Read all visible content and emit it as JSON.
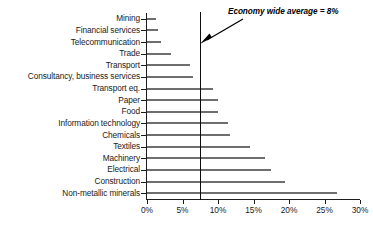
{
  "chart_data": {
    "type": "bar",
    "orientation": "horizontal",
    "title": "",
    "subtitle": "",
    "xlabel": "",
    "ylabel": "",
    "xlim": [
      0,
      30
    ],
    "xtick_labels": [
      "0%",
      "5%",
      "10%",
      "15%",
      "20%",
      "25%",
      "30%"
    ],
    "xtick_values": [
      0,
      5,
      10,
      15,
      20,
      25,
      30
    ],
    "grid": false,
    "legend": null,
    "categories": [
      "Mining",
      "Financial services",
      "Telecommunication",
      "Trade",
      "Transport",
      "Consultancy, business services",
      "Transport eq.",
      "Paper",
      "Food",
      "Information technology",
      "Chemicals",
      "Textiles",
      "Machinery",
      "Electrical",
      "Construction",
      "Non-metallic minerals"
    ],
    "values": [
      1.2,
      1.6,
      2.0,
      3.4,
      6.1,
      6.5,
      9.3,
      10.0,
      10.0,
      11.4,
      11.7,
      14.5,
      16.6,
      17.4,
      19.5,
      26.8
    ],
    "annotations": [
      {
        "text": "Economy wide average = 8%",
        "reference_line_value": 7.5,
        "style": "bold-italic",
        "arrow": "down-left"
      }
    ],
    "bar_color": "#6e6e6e",
    "axis_color": "#1c1c1c",
    "reference_line_color": "#0d0d0d",
    "background_color": "#ffffff"
  }
}
